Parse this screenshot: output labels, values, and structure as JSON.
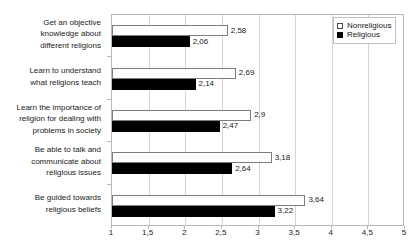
{
  "chart_data": {
    "type": "bar",
    "orientation": "horizontal",
    "title": "",
    "xlabel": "",
    "ylabel": "",
    "xlim": [
      1,
      5
    ],
    "grid": true,
    "legend_position": "top-right",
    "decimal_separator": ",",
    "xticks": [
      "1",
      "1,5",
      "2",
      "2,5",
      "3",
      "3,5",
      "4",
      "4,5",
      "5"
    ],
    "xtick_values": [
      1,
      1.5,
      2,
      2.5,
      3,
      3.5,
      4,
      4.5,
      5
    ],
    "categories": [
      "Get an objective knowledge about different religions",
      "Learn to understand what religions teach",
      "Learn the importance of religion for dealing with problems in society",
      "Be able to talk and communicate about religious issues",
      "Be guided towards religious beliefs"
    ],
    "category_lines": [
      [
        "Get an objective",
        "knowledge about",
        "different religions"
      ],
      [
        "Learn to understand",
        "what religions teach"
      ],
      [
        "Learn the importance of",
        "religion for dealing with",
        "problems in society"
      ],
      [
        "Be able to talk and",
        "communicate about",
        "religious issues"
      ],
      [
        "Be guided towards",
        "religious beliefs"
      ]
    ],
    "series": [
      {
        "name": "Nonreligious",
        "color": "#ffffff",
        "border_color": "#7d7d7d",
        "values": [
          2.58,
          2.69,
          2.9,
          3.18,
          3.64
        ],
        "labels": [
          "2,58",
          "2,69",
          "2,9",
          "3,18",
          "3,64"
        ]
      },
      {
        "name": "Religious",
        "color": "#000000",
        "border_color": "#000000",
        "values": [
          2.06,
          2.14,
          2.47,
          2.64,
          3.22
        ],
        "labels": [
          "2,06",
          "2,14",
          "2,47",
          "2,64",
          "3,22"
        ]
      }
    ]
  },
  "legend": {
    "items": [
      {
        "label": "Nonreligious",
        "style": "nonreligious"
      },
      {
        "label": "Religious",
        "style": "religious"
      }
    ]
  }
}
